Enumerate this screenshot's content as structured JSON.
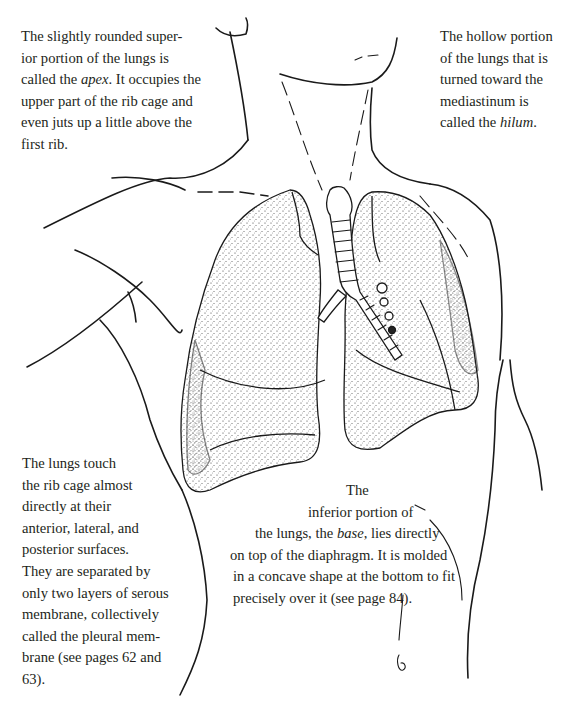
{
  "figure": {
    "captions": {
      "apex": {
        "lines": [
          "The slightly rounded super-",
          "ior portion of the lungs is",
          "called the ",
          "apex",
          ". It occupies the",
          "upper part of the rib cage and",
          "even juts up a little above the",
          "first rib."
        ]
      },
      "hilum": {
        "lines": [
          "The hollow portion",
          "of the lungs that is",
          "turned toward the",
          "mediastinum is",
          "called the ",
          "hilum",
          "."
        ]
      },
      "contact": {
        "lines": [
          "The lungs touch",
          "the rib cage almost",
          "directly at their",
          "anterior, lateral, and",
          "posterior surfaces.",
          "They are separated by",
          "only two layers of serous",
          "membrane, collectively",
          "called the pleural mem-",
          "brane (see pages 62 and",
          "63)."
        ]
      },
      "base": {
        "lines": [
          "The",
          "inferior portion of",
          "the lungs, the ",
          "base",
          ", lies directly",
          "on top of the diaphragm. It is molded",
          "in a concave shape at the bottom to fit",
          "precisely over it (see page 84)."
        ]
      }
    },
    "colors": {
      "ink": "#1a1a1a",
      "text": "#231f20",
      "background": "#ffffff"
    }
  }
}
